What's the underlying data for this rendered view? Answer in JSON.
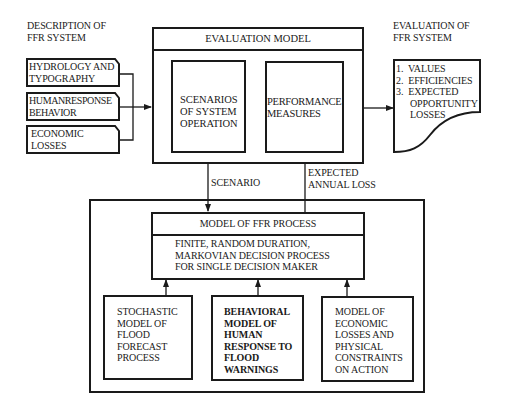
{
  "left_heading": {
    "line1": "DESCRIPTION OF",
    "line2": "FFR SYSTEM"
  },
  "right_heading": {
    "line1": "EVALUATION OF",
    "line2": "FFR SYSTEM"
  },
  "inputs": [
    {
      "line1": "HYDROLOGY AND",
      "line2": "TYPOGRAPHY"
    },
    {
      "line1": "HUMANRESPONSE",
      "line2": "BEHAVIOR"
    },
    {
      "line1": "ECONOMIC",
      "line2": "LOSSES"
    }
  ],
  "evaluation_model": {
    "title": "EVALUATION MODEL",
    "scenarios": {
      "line1": "SCENARIOS",
      "line2": "OF SYSTEM",
      "line3": "OPERATION"
    },
    "performance": {
      "line1": "PERFORMANCE",
      "line2": "MEASURES"
    }
  },
  "outputs": {
    "items": [
      {
        "num": "1.",
        "line1": "VALUES"
      },
      {
        "num": "2.",
        "line1": "EFFICIENCIES"
      },
      {
        "num": "3.",
        "line1": "EXPECTED",
        "line2": "OPPORTUNITY",
        "line3": "LOSSES"
      }
    ]
  },
  "connectors": {
    "scenario": "SCENARIO",
    "expected_loss": {
      "line1": "EXPECTED",
      "line2": "ANNUAL LOSS"
    }
  },
  "ffr_process": {
    "title": "MODEL OF FFR PROCESS",
    "desc": {
      "line1": "FINITE, RANDOM DURATION,",
      "line2": "MARKOVIAN DECISION PROCESS",
      "line3": "FOR SINGLE DECISION MAKER"
    }
  },
  "submodels": [
    {
      "lines": [
        "STOCHASTIC",
        "MODEL OF",
        "FLOOD",
        "FORECAST",
        "PROCESS"
      ]
    },
    {
      "lines": [
        "BEHAVIORAL",
        "MODEL OF",
        "HUMAN",
        "RESPONSE TO",
        "FLOOD",
        "WARNINGS"
      ]
    },
    {
      "lines": [
        "MODEL OF",
        "ECONOMIC",
        "LOSSES AND",
        "PHYSICAL",
        "CONSTRAINTS",
        "ON ACTION"
      ]
    }
  ]
}
